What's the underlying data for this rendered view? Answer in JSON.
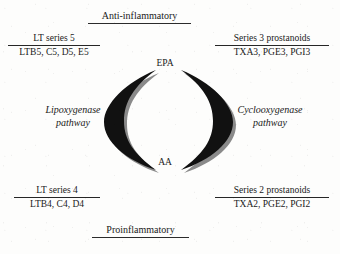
{
  "figure": {
    "top_banner": {
      "label": "Anti-inflammatory"
    },
    "bottom_banner": {
      "label": "Proinflammatory"
    },
    "substrates": {
      "top": "EPA",
      "bottom": "AA"
    },
    "pathways": {
      "left": {
        "line1": "Lipoxygenase",
        "line2": "pathway"
      },
      "right": {
        "line1": "Cyclooxygenase",
        "line2": "pathway"
      }
    },
    "products": {
      "top_left": {
        "title": "LT series 5",
        "items": "LTB5, C5, D5, E5"
      },
      "top_right": {
        "title": "Series 3 prostanoids",
        "items": "TXA3, PGE3, PGI3"
      },
      "bottom_left": {
        "title": "LT series 4",
        "items": "LTB4, C4, D4"
      },
      "bottom_right": {
        "title": "Series 2 prostanoids",
        "items": "TXA2, PGE2, PGI2"
      }
    },
    "colors": {
      "ink": "#1a1a1a",
      "arrow_fill": "#111111",
      "arrow_shadow": "#8a8a8a",
      "background": "#fdfdfc"
    }
  }
}
